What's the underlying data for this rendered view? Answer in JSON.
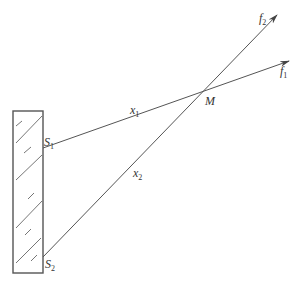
{
  "diagram": {
    "colors": {
      "stroke": "#555555",
      "text": "#333333",
      "background": "#ffffff"
    },
    "wall": {
      "x": 13,
      "y": 111,
      "width": 30,
      "height": 162
    },
    "labels": {
      "s1": {
        "base": "S",
        "sub": "1"
      },
      "s2": {
        "base": "S",
        "sub": "2"
      },
      "x1": {
        "base": "x",
        "sub": "1"
      },
      "x2": {
        "base": "x",
        "sub": "2"
      },
      "m": {
        "base": "M"
      },
      "f1": {
        "base": "f",
        "sub": "1"
      },
      "f2": {
        "base": "f",
        "sub": "2"
      }
    },
    "lines": [
      {
        "name": "ray-s1-f1",
        "from": [
          43,
          148
        ],
        "to": [
          289,
          61
        ]
      },
      {
        "name": "ray-s2-f2",
        "from": [
          43,
          257
        ],
        "to": [
          277,
          15
        ]
      }
    ],
    "intersection_point": {
      "label": "M",
      "x": 205,
      "y": 90
    }
  }
}
